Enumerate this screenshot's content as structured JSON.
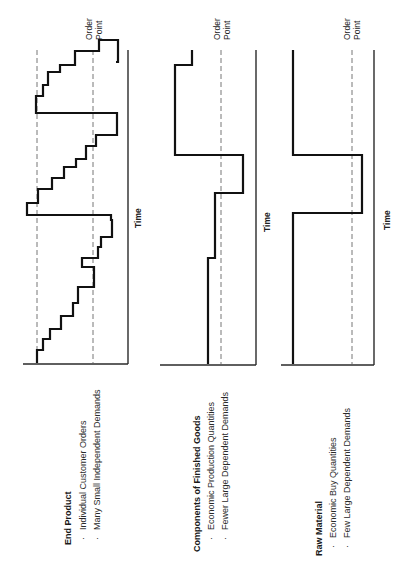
{
  "orientation": "rotated-90-ccw",
  "chart_data": [
    {
      "type": "line",
      "step": true,
      "title": "End Product",
      "bullets": [
        "Individual Customer Orders",
        "Many Small Independent Demands"
      ],
      "xlabel": "Time",
      "ylabel": "",
      "reference_lines": [
        {
          "label": "Order Point",
          "style": "dashed"
        },
        {
          "label": "",
          "style": "dashed",
          "note": "upper level"
        }
      ],
      "description": "Frequent small stepwise depletions with periodic replenishment back above the upper level",
      "x": [
        0,
        1,
        2,
        3,
        4,
        5,
        6,
        7,
        8,
        9,
        10,
        11,
        12,
        13,
        14,
        15,
        16,
        17,
        18,
        19,
        20,
        21,
        22,
        23,
        24,
        25,
        26
      ],
      "values": [
        1.0,
        0.95,
        0.85,
        0.8,
        0.65,
        0.55,
        0.45,
        0.35,
        0.15,
        0.15,
        1.1,
        1.0,
        0.9,
        0.8,
        0.62,
        0.5,
        0.4,
        0.35,
        0.12,
        0.12,
        1.12,
        1.0,
        0.82,
        0.7,
        0.6,
        0.45,
        0.3
      ]
    },
    {
      "type": "line",
      "step": true,
      "title": "Components of Finished Goods",
      "bullets": [
        "Economic Production Quantities",
        "Fewer Large Dependent Demands"
      ],
      "xlabel": "Time",
      "ylabel": "",
      "reference_lines": [
        {
          "label": "Order Point",
          "style": "dashed"
        }
      ],
      "description": "Few large stepwise depletions with replenishment in economic production quantities",
      "x": [
        0,
        1,
        2,
        3,
        4
      ],
      "values": [
        0.55,
        0.72,
        0.35,
        1.0,
        0.6
      ]
    },
    {
      "type": "line",
      "step": true,
      "title": "Raw Material",
      "bullets": [
        "Economic Buy Quantities",
        "Few Large Dependent Demands"
      ],
      "xlabel": "Time",
      "ylabel": "",
      "reference_lines": [
        {
          "label": "Order Point",
          "style": "dashed"
        }
      ],
      "description": "Long flat periods with a single large drop and economic-buy replenishment",
      "x": [
        0,
        1,
        2
      ],
      "values": [
        1.0,
        0.25,
        1.0
      ]
    }
  ],
  "panels": [
    {
      "title": "End Product",
      "bullets": [
        "Individual Customer Orders",
        "Many Small Independent Demands"
      ],
      "time_label": "Time",
      "order_point_label": [
        "Order",
        "Point"
      ],
      "axis": {
        "x": 128,
        "y_top": 50,
        "y_bottom": 363,
        "base_x_start": 23
      },
      "dashed": [
        37,
        93
      ],
      "path": "M37,363 L37,350 L43,350 L43,339 L50,339 L50,329 L61,329 L61,316 L73,316 L73,303 L78,303 L78,287 L94,287 L94,267 L82,267 L82,258 L98,258 L98,247 L101,247 L101,237 L112,237 L112,220 L111,220 L111,215 L27,215 L27,203 L38,203 L38,189 L52,189 L52,178 L64,178 L64,167 L76,167 L76,159 L86,159 L86,146 L96,146 L96,135 L117,135 L117,113 L36,113 L36,96 L43,96 L43,85 L48,85 L48,72 L60,72 L60,65 L75,65 L75,51 L99,51 L99,40 L118,40 L118,62 L116,62"
    },
    {
      "title": "Components of Finished Goods",
      "bullets": [
        "Economic Production Quantities",
        "Fewer Large Dependent Demands"
      ],
      "time_label": "Time",
      "order_point_label": [
        "Order",
        "Point"
      ],
      "axis": {
        "x": 256,
        "y_top": 50,
        "y_bottom": 364,
        "base_x_start": 160
      },
      "dashed": [
        221
      ],
      "path": "M208,364 L208,258 L215,258 L215,193 L243,193 L243,155 L175,155 L175,65 L192,65 L192,50"
    },
    {
      "title": "Raw Material",
      "bullets": [
        "Economic Buy Quantities",
        "Few Large Dependent Demands"
      ],
      "time_label": "Time",
      "order_point_label": [
        "Order",
        "Point"
      ],
      "axis": {
        "x": 374,
        "y_top": 50,
        "y_bottom": 364,
        "base_x_start": 281
      },
      "dashed": [
        352
      ],
      "path": "M293,364 L293,213 L362,213 L362,155 L293,155 L293,50"
    }
  ]
}
